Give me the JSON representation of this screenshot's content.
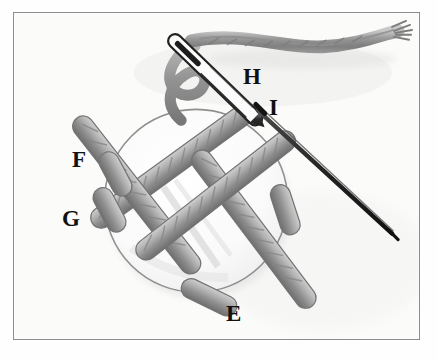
{
  "figure": {
    "medium": "pencil-sketch-illustration",
    "background_color": "#fbfbfa",
    "frame_color": "#8d8d8d",
    "paper_color": "#fefefe"
  },
  "labels": [
    {
      "id": "E",
      "text": "E",
      "target": "lower-cord-end",
      "x": 226,
      "y": 302
    },
    {
      "id": "F",
      "text": "F",
      "target": "left-upper-cord-end",
      "x": 72,
      "y": 148
    },
    {
      "id": "G",
      "text": "G",
      "target": "left-lower-cord-end",
      "x": 62,
      "y": 207
    },
    {
      "id": "H",
      "text": "H",
      "target": "needle-with-thread",
      "x": 243,
      "y": 65
    },
    {
      "id": "I",
      "text": "I",
      "target": "straight-pin",
      "x": 268,
      "y": 96
    }
  ],
  "parts": {
    "button": {
      "name": "round-button",
      "center_x": 196,
      "center_y": 201,
      "radius": 92,
      "fill": "#fcfcfb",
      "outline": "#8a8a8a"
    },
    "needle": {
      "name": "threaded-sewing-needle",
      "eye_x": 166,
      "eye_y": 33,
      "tip_x": 233,
      "tip_y": 100,
      "color": "#3a3a3a"
    },
    "thread": {
      "name": "thread-strand",
      "color": "#8e8e8e",
      "start_x": 180,
      "start_y": 38,
      "end_x": 395,
      "end_y": 34
    },
    "pin": {
      "name": "straight-pin",
      "head_x": 258,
      "head_y": 110,
      "tip_x": 392,
      "tip_y": 234,
      "color": "#2f2f2f"
    },
    "cords": {
      "name": "woven-cord-square",
      "count": 4,
      "color_light": "#b9b9b9",
      "color_mid": "#9a9a9a",
      "color_dark": "#787878"
    }
  },
  "accent_colors": {
    "ink": "#111111",
    "graphite_light": "#c4c4c4",
    "graphite_mid": "#9a9a9a",
    "graphite_dark": "#5c5c5c"
  }
}
